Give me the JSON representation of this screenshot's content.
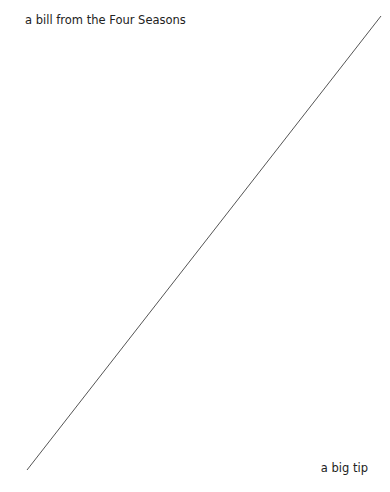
{
  "labels": {
    "top_left": "a bill from the Four Seasons",
    "bottom_right": "a big tip"
  },
  "line": {
    "x1": 27,
    "y1": 470,
    "x2": 381,
    "y2": 16,
    "color": "#555555",
    "width": 1
  }
}
